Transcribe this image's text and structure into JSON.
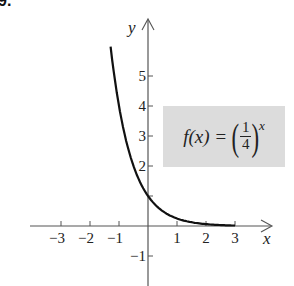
{
  "problem_number": "9.",
  "formula": {
    "lhs": "f(x)",
    "equals": "=",
    "base_numerator": "1",
    "base_denominator": "4",
    "exponent": "x",
    "box_color": "#dcdcdc"
  },
  "chart_data": {
    "type": "line",
    "title": "",
    "function": "f(x) = (1/4)^x",
    "xlabel": "x",
    "ylabel": "y",
    "xlim": [
      -4,
      4.3
    ],
    "ylim": [
      -2,
      7
    ],
    "x_ticks": [
      -3,
      -2,
      -1,
      1,
      2,
      3
    ],
    "x_tick_labels": [
      "−3",
      "−2",
      "−1",
      "1",
      "2",
      "3"
    ],
    "y_ticks": [
      -1,
      1,
      2,
      3,
      4,
      5
    ],
    "y_tick_labels": [
      "−1",
      "",
      "2",
      "3",
      "4",
      "5"
    ],
    "grid": false,
    "series": [
      {
        "name": "f(x) = (1/4)^x",
        "x": [
          -1.29,
          -1.0,
          -0.75,
          -0.5,
          -0.25,
          0,
          0.25,
          0.5,
          0.75,
          1.0,
          1.5,
          2.0,
          2.5,
          3.0
        ],
        "y": [
          6.0,
          4.0,
          2.83,
          2.0,
          1.41,
          1.0,
          0.71,
          0.5,
          0.35,
          0.25,
          0.125,
          0.0625,
          0.031,
          0.016
        ],
        "color": "#111111"
      }
    ]
  }
}
